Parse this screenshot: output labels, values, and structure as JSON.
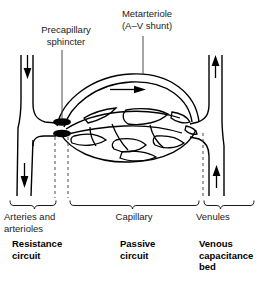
{
  "figure": {
    "stroke_color": "#000000",
    "text_color": "#1a1a1a",
    "background": "#ffffff",
    "sphincter_fill": "#000000"
  },
  "callouts": {
    "precapillary_sphincter": "Precapillary\nsphincter",
    "metarteriole": "Metarteriole\n(A–V shunt)"
  },
  "segments": {
    "arteries": "Arteries and\narterioles",
    "capillary": "Capillary",
    "venules": "Venules"
  },
  "circuits": {
    "resistance": "Resistance\ncircuit",
    "passive": "Passive\ncircuit",
    "venous": "Venous\ncapacitance\nbed"
  },
  "flow": {
    "arteriole_in": "downward-arrow",
    "arteriole_out": "downward-arrow",
    "venule_up_top": "upward-arrow",
    "venule_up_bottom": "upward-arrow",
    "metarteriole_flow": "rightward-arrow"
  }
}
